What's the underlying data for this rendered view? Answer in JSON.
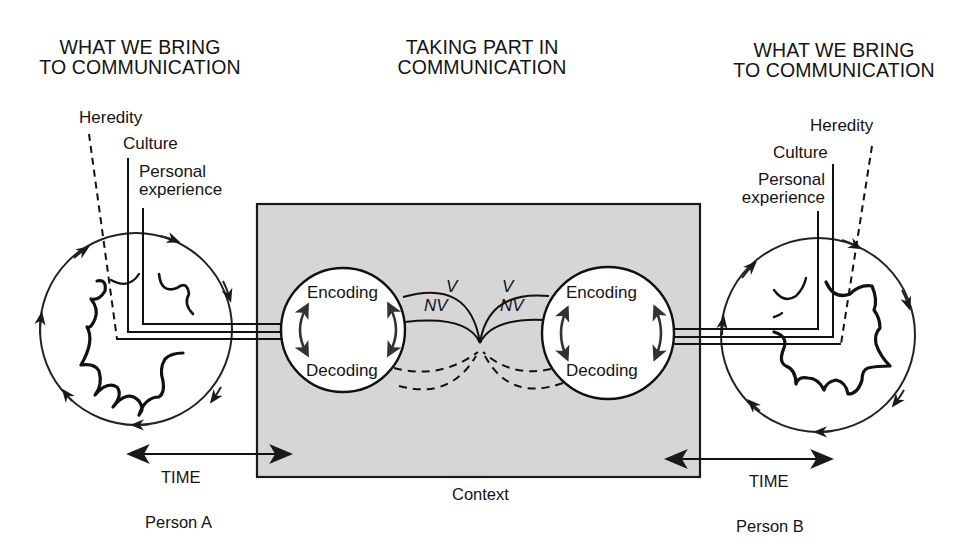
{
  "headings": {
    "left": [
      "WHAT WE BRING",
      "TO COMMUNICATION"
    ],
    "center": [
      "TAKING PART IN",
      "COMMUNICATION"
    ],
    "right": [
      "WHAT WE BRING",
      "TO COMMUNICATION"
    ]
  },
  "person_a": {
    "factors": {
      "heredity": "Heredity",
      "culture": "Culture",
      "personal_experience": [
        "Personal",
        "experience"
      ]
    },
    "process": {
      "encoding": "Encoding",
      "decoding": "Decoding"
    },
    "time_label": "TIME",
    "name": "Person A"
  },
  "person_b": {
    "factors": {
      "heredity": "Heredity",
      "culture": "Culture",
      "personal_experience": [
        "Personal",
        "experience"
      ]
    },
    "process": {
      "encoding": "Encoding",
      "decoding": "Decoding"
    },
    "time_label": "TIME",
    "name": "Person B"
  },
  "channels": {
    "verbal": "V",
    "nonverbal": "NV"
  },
  "context": {
    "label": "Context",
    "fill_color": "#d6d6d6"
  },
  "colors": {
    "line": "#1a1a1a",
    "background": "#ffffff"
  }
}
